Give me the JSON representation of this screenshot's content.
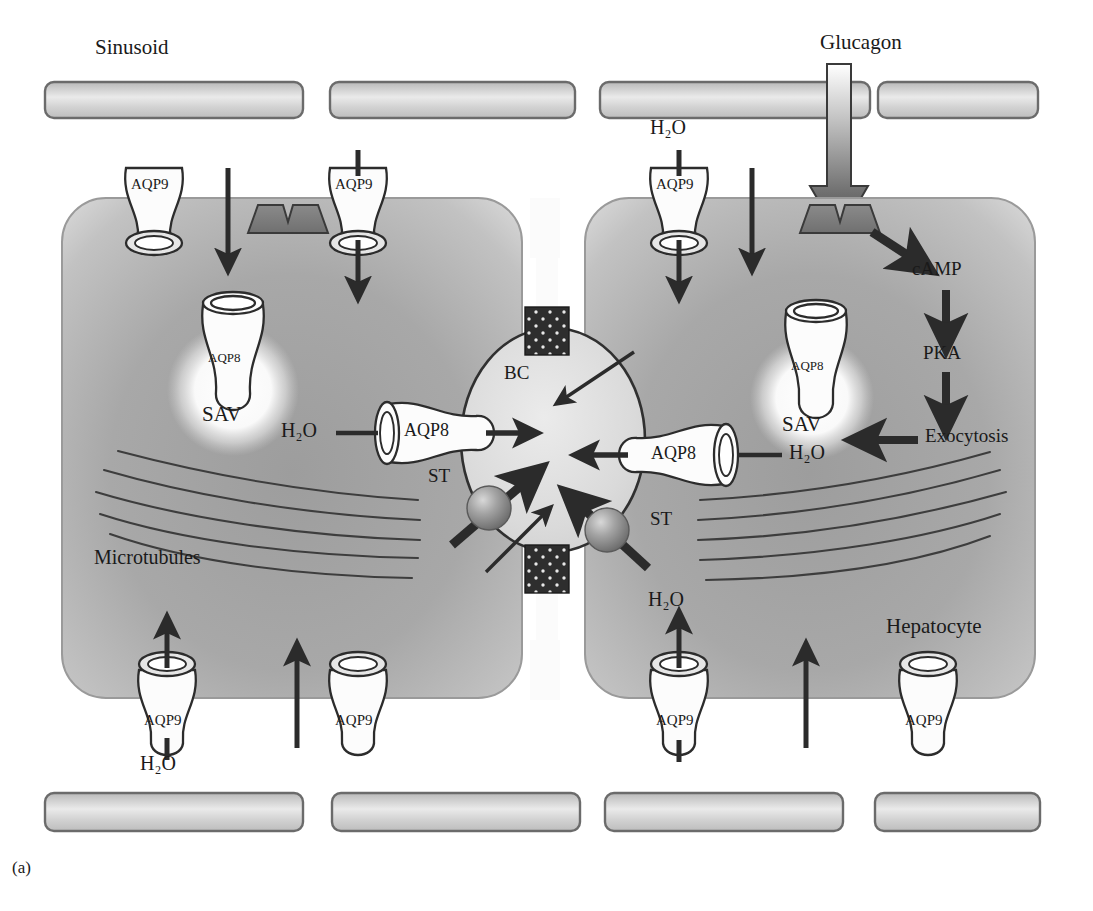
{
  "figure": {
    "caption": "(a)",
    "domain": "biological cell signalling diagram",
    "labels": {
      "sinusoid": "Sinusoid",
      "glucagon": "Glucagon",
      "hepatocyte": "Hepatocyte",
      "microtubules": "Microtubules",
      "bile_canaliculus": "BC",
      "storage_vesicle": "SAV",
      "secretory_transporter": "ST",
      "water": "H₂O",
      "camp": "cAMP",
      "pka": "PKA",
      "exocytosis": "Exocytosis",
      "aqp8": "AQP8",
      "aqp9": "AQP9"
    }
  },
  "colors": {
    "cell_fill_outer": "#c9c9c9",
    "cell_fill_inner": "#a6a6a6",
    "cell_stroke": "#8d8d8d",
    "sinusoid_fill": "#d3d3d3",
    "sinusoid_stroke": "#6b6b6b",
    "receptor_fill": "#7d7d7d",
    "receptor_stroke": "#3a3a3a",
    "arrow_dark": "#2b2b2b",
    "bc_fill": "#dcdcdc",
    "bc_stroke": "#303030",
    "tight_junction_fill": "#2e2e2e",
    "vesicle_glow": "#fdfdfd",
    "channel_fill": "#fbfbfb",
    "channel_stroke": "#2c2c2c",
    "text": "#1a1a1a",
    "st_sphere": "#9a9a9a",
    "microtubule_stroke": "#3d3d3d",
    "background": "#ffffff"
  },
  "sinusoid_bars": {
    "top": [
      {
        "x": 45,
        "y": 82,
        "w": 258,
        "h": 36
      },
      {
        "x": 330,
        "y": 82,
        "w": 245,
        "h": 36
      },
      {
        "x": 600,
        "y": 82,
        "w": 270,
        "h": 36
      },
      {
        "x": 878,
        "y": 82,
        "w": 160,
        "h": 36
      }
    ],
    "bottom": [
      {
        "x": 45,
        "y": 793,
        "w": 258,
        "h": 38
      },
      {
        "x": 332,
        "y": 793,
        "w": 248,
        "h": 38
      },
      {
        "x": 605,
        "y": 793,
        "w": 238,
        "h": 38
      },
      {
        "x": 875,
        "y": 793,
        "w": 165,
        "h": 38
      }
    ]
  },
  "cells": [
    {
      "name": "left-hepatocyte",
      "x": 62,
      "y": 198,
      "w": 460,
      "h": 500,
      "rx": 44
    },
    {
      "name": "right-hepatocyte",
      "x": 585,
      "y": 198,
      "w": 450,
      "h": 500,
      "rx": 44
    }
  ],
  "aqp9_channels": [
    {
      "id": "aqp9-top-left-1",
      "x": 148,
      "y": 164,
      "label": "AQP9",
      "membrane": "basolateral-top",
      "arrow": "down-into-cell",
      "arrow_only_inside": true
    },
    {
      "id": "aqp9-top-left-2",
      "x": 351,
      "y": 164,
      "label": "AQP9",
      "membrane": "basolateral-top",
      "arrow": "down-through"
    },
    {
      "id": "aqp9-top-right-1",
      "x": 672,
      "y": 164,
      "label": "AQP9",
      "membrane": "basolateral-top",
      "arrow": "down-through",
      "water_label": "H₂O"
    },
    {
      "id": "aqp9-bot-left-1",
      "x": 166,
      "y": 662,
      "label": "AQP9",
      "membrane": "basolateral-bottom",
      "arrow": "up-through",
      "water_label": "H₂O"
    },
    {
      "id": "aqp9-bot-left-2",
      "x": 352,
      "y": 662,
      "label": "AQP9",
      "membrane": "basolateral-bottom",
      "arrow": "none"
    },
    {
      "id": "aqp9-bot-right-1",
      "x": 671,
      "y": 662,
      "label": "AQP9",
      "membrane": "basolateral-bottom",
      "arrow": "up-through",
      "water_label": "H₂O"
    },
    {
      "id": "aqp9-bot-right-2",
      "x": 927,
      "y": 662,
      "label": "AQP9",
      "membrane": "basolateral-bottom",
      "arrow": "none"
    }
  ],
  "membrane_arrows": [
    {
      "id": "arrow-left-top-inward",
      "x": 228,
      "y1": 172,
      "y2": 262,
      "dir": "down"
    },
    {
      "id": "arrow-right-top-inward",
      "x": 752,
      "y1": 172,
      "y2": 262,
      "dir": "down"
    },
    {
      "id": "arrow-left-bot-outward",
      "x": 297,
      "y1": 740,
      "y2": 650,
      "dir": "up"
    },
    {
      "id": "arrow-right-bot-outward",
      "x": 806,
      "y1": 740,
      "y2": 650,
      "dir": "up"
    }
  ],
  "receptors": [
    {
      "id": "receptor-left",
      "x": 248,
      "y": 205,
      "w": 78,
      "h": 28,
      "state": "unbound"
    },
    {
      "id": "receptor-right",
      "x": 800,
      "y": 205,
      "w": 78,
      "h": 28,
      "state": "glucagon-bound"
    }
  ],
  "glucagon_arrow": {
    "x": 839,
    "y_top": 64,
    "y_bottom": 232,
    "width": 24,
    "head_width": 58
  },
  "sav_vesicles": [
    {
      "id": "sav-left",
      "cx": 233,
      "cy": 385,
      "r": 58,
      "label": "SAV",
      "channel_label": "AQP8"
    },
    {
      "id": "sav-right",
      "cx": 812,
      "cy": 395,
      "r": 55,
      "label": "SAV",
      "channel_label": "AQP8"
    }
  ],
  "bile_canaliculus": {
    "cx": 553,
    "cy": 440,
    "rx": 92,
    "ry": 112,
    "label": "BC"
  },
  "tight_junctions": [
    {
      "id": "tj-top",
      "x": 525,
      "y": 307,
      "w": 44,
      "h": 48
    },
    {
      "id": "tj-bottom",
      "x": 525,
      "y": 545,
      "w": 44,
      "h": 48
    }
  ],
  "apical_aqp8": [
    {
      "id": "aqp8-apical-left",
      "label": "AQP8",
      "water_label": "H₂O",
      "side": "left",
      "x": 392,
      "y": 420
    },
    {
      "id": "aqp8-apical-right",
      "label": "AQP8",
      "water_label": "H₂O",
      "side": "right",
      "x": 612,
      "y": 440
    }
  ],
  "st_particles": [
    {
      "id": "st-left",
      "cx": 489,
      "cy": 505,
      "r": 21,
      "label": "ST",
      "label_x": 430,
      "label_y": 478
    },
    {
      "id": "st-right",
      "cx": 607,
      "cy": 525,
      "r": 21,
      "label": "ST",
      "label_x": 650,
      "label_y": 525
    }
  ],
  "signalling_cascade": {
    "steps": [
      "cAMP",
      "PKA",
      "Exocytosis"
    ],
    "target": "SAV",
    "positions": {
      "camp": {
        "x": 928,
        "y": 272
      },
      "pka": {
        "x": 935,
        "y": 355
      },
      "exo": {
        "x": 935,
        "y": 437
      }
    }
  },
  "microtubules": {
    "label": "Microtubules",
    "left_count": 5,
    "right_count": 5
  },
  "text_positions": {
    "sinusoid": {
      "x": 95,
      "y": 50
    },
    "glucagon": {
      "x": 822,
      "y": 32
    },
    "hepatocyte": {
      "x": 888,
      "y": 615
    },
    "microtubules": {
      "x": 95,
      "y": 545
    },
    "caption": {
      "x": 12,
      "y": 860
    },
    "h2o_top_right": {
      "x": 652,
      "y": 120
    },
    "h2o_bot_left": {
      "x": 142,
      "y": 755
    },
    "h2o_bot_right": {
      "x": 648,
      "y": 590
    }
  }
}
